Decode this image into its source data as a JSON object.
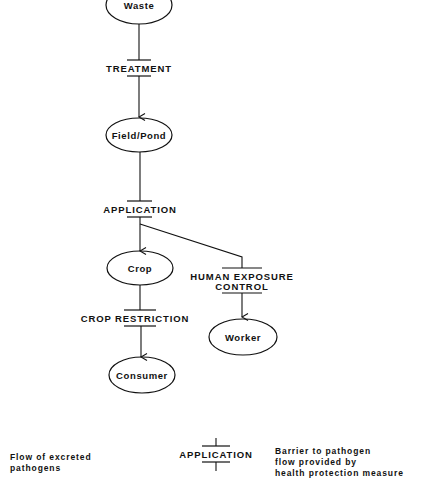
{
  "diagram": {
    "nodes": {
      "waste": "Waste",
      "field_pond": "Field/Pond",
      "crop": "Crop",
      "consumer": "Consumer",
      "worker": "Worker"
    },
    "barriers": {
      "treatment": "TREATMENT",
      "application": "APPLICATION",
      "crop_restriction": "CROP RESTRICTION",
      "human_exposure_line1": "HUMAN EXPOSURE",
      "human_exposure_line2": "CONTROL"
    },
    "edges": [
      {
        "from": "Waste",
        "to": "Field/Pond",
        "barrier": "TREATMENT"
      },
      {
        "from": "Field/Pond",
        "to": "Crop",
        "barrier": "APPLICATION"
      },
      {
        "from": "Field/Pond",
        "to": "Worker",
        "barrier": "APPLICATION, HUMAN EXPOSURE CONTROL"
      },
      {
        "from": "Crop",
        "to": "Consumer",
        "barrier": "CROP RESTRICTION"
      }
    ]
  },
  "legend": {
    "flow_label": "Flow of excreted\npathogens",
    "barrier_example": "APPLICATION",
    "barrier_description": "Barrier to pathogen\nflow provided by\nhealth protection measure"
  },
  "colors": {
    "stroke": "#111111",
    "background": "#ffffff"
  }
}
